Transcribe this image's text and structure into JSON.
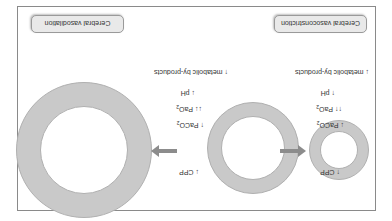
{
  "orientation": "rotated-180",
  "panels": {
    "vasoconstriction": {
      "title": "Cerebral vasoconstriction",
      "factors": {
        "cpp": "↑ CPP",
        "paco2_arrow": "↓ PaCO",
        "paco2_sub": "2",
        "pao2_arrow": "↑↑ PaO",
        "pao2_sub": "2",
        "ph": "↑ pH",
        "metabolic": "↓ metabolic by-products"
      },
      "arrow_direction": "left"
    },
    "vasodilation": {
      "title": "Cerebral vasodilation",
      "factors": {
        "cpp": "↓ CPP",
        "paco2_arrow": "↑ PaCO",
        "paco2_sub": "2",
        "pao2_arrow": "↓↓ PaO",
        "pao2_sub": "2",
        "ph": "↓ pH",
        "metabolic": "↑ metabolic by-products"
      },
      "arrow_direction": "right"
    }
  },
  "vessels": [
    {
      "name": "constricted-vessel",
      "size": "small"
    },
    {
      "name": "normal-vessel",
      "size": "medium"
    },
    {
      "name": "dilated-vessel",
      "size": "large"
    }
  ],
  "colors": {
    "vessel_wall": "#c9c9c9",
    "arrow": "#8c8c8c",
    "label_bg": "#e9e9e9",
    "frame": "#8a8a8a"
  }
}
